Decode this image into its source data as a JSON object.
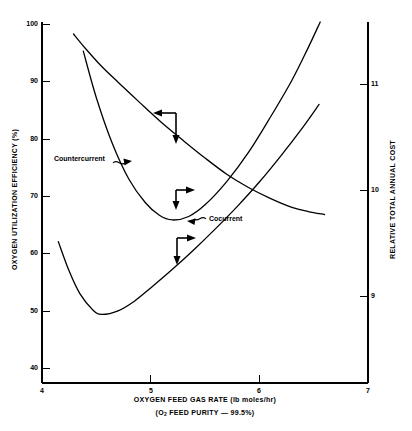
{
  "chart_data": {
    "type": "line",
    "title": "",
    "xlabel": "OXYGEN FEED GAS RATE (lb moles/hr)",
    "xlabel_sub": "(O2 FEED PURITY — 99.5%)",
    "ylabel_left": "OXYGEN UTILIZATION EFFICIENCY (%)",
    "ylabel_right": "RELATIVE TOTAL ANNUAL COST",
    "xlim": [
      4,
      7
    ],
    "ylim_left": [
      40,
      100
    ],
    "ylim_right": [
      8.5,
      11.6
    ],
    "xticks": [
      "4",
      "5",
      "6",
      "7"
    ],
    "xtick_values": [
      4,
      5,
      6,
      7
    ],
    "yticks_left": [
      "100",
      "90",
      "80",
      "70",
      "60",
      "50",
      "40"
    ],
    "ytick_values_left": [
      100,
      90,
      80,
      70,
      60,
      50,
      40
    ],
    "yticks_right": [
      "11",
      "10",
      "9"
    ],
    "ytick_values_right": [
      11,
      10,
      9
    ],
    "grid": false,
    "legend": "inline-annotations",
    "series": [
      {
        "name": "Countercurrent oxygen utilization efficiency",
        "axis": "left",
        "units": "%",
        "points": [
          [
            4.29,
            98.0
          ],
          [
            4.4,
            95.6
          ],
          [
            4.55,
            92.6
          ],
          [
            4.7,
            90.0
          ],
          [
            4.9,
            86.6
          ],
          [
            5.1,
            83.3
          ],
          [
            5.3,
            80.3
          ],
          [
            5.5,
            77.4
          ],
          [
            5.7,
            74.7
          ],
          [
            5.9,
            72.5
          ],
          [
            6.1,
            70.7
          ],
          [
            6.3,
            69.2
          ],
          [
            6.45,
            68.5
          ],
          [
            6.6,
            68.0
          ]
        ]
      },
      {
        "name": "Cocurrent oxygen utilization efficiency",
        "axis": "left",
        "units": "%",
        "points": [
          [
            4.15,
            63.5
          ],
          [
            4.25,
            58.6
          ],
          [
            4.35,
            54.8
          ],
          [
            4.47,
            52.1
          ],
          [
            4.55,
            51.4
          ],
          [
            4.7,
            52.0
          ],
          [
            4.85,
            53.6
          ],
          [
            5.0,
            55.8
          ],
          [
            5.2,
            58.9
          ],
          [
            5.4,
            62.2
          ],
          [
            5.6,
            65.7
          ],
          [
            5.8,
            69.4
          ],
          [
            6.0,
            73.4
          ],
          [
            6.2,
            77.8
          ],
          [
            6.4,
            82.5
          ],
          [
            6.55,
            86.3
          ]
        ]
      },
      {
        "name": "Countercurrent relative total annual cost",
        "axis": "right",
        "units": "relative",
        "points": [
          [
            4.38,
            11.35
          ],
          [
            4.5,
            10.95
          ],
          [
            4.65,
            10.55
          ],
          [
            4.8,
            10.25
          ],
          [
            4.95,
            10.05
          ],
          [
            5.08,
            9.94
          ],
          [
            5.2,
            9.9
          ],
          [
            5.35,
            9.93
          ],
          [
            5.5,
            10.03
          ],
          [
            5.7,
            10.23
          ],
          [
            5.9,
            10.48
          ],
          [
            6.1,
            10.78
          ],
          [
            6.3,
            11.1
          ],
          [
            6.45,
            11.38
          ],
          [
            6.56,
            11.6
          ]
        ]
      }
    ],
    "annotations": [
      {
        "id": "annotation-left-down-top",
        "type": "axis-pointer",
        "description": "Left arrow then down arrow indicating left-axis series",
        "corner": [
          5.22,
          84.8
        ],
        "directions": [
          "left",
          "down"
        ]
      },
      {
        "id": "annotation-right-down-middle",
        "type": "axis-pointer",
        "description": "Right arrow then down arrow indicating right-axis series",
        "corner": [
          5.23,
          70.4
        ],
        "directions": [
          "right",
          "down"
        ]
      },
      {
        "id": "annotation-right-down-bottom",
        "type": "axis-pointer",
        "description": "Right arrow then down arrow indicating left-axis series",
        "corner": [
          5.24,
          62.0
        ],
        "directions": [
          "right",
          "down"
        ]
      }
    ],
    "curve_labels": [
      {
        "id": "countercurrent",
        "text": "Countercurrent",
        "x": 4.35,
        "y": 75.5
      },
      {
        "id": "cocurrent",
        "text": "Cocurrent",
        "x": 5.62,
        "y": 64.8
      }
    ]
  },
  "axes": {
    "left": {
      "title": "OXYGEN UTILIZATION EFFICIENCY (%)",
      "ticks": [
        {
          "label": "100"
        },
        {
          "label": "90"
        },
        {
          "label": "80"
        },
        {
          "label": "70"
        },
        {
          "label": "60"
        },
        {
          "label": "50"
        },
        {
          "label": "40"
        }
      ]
    },
    "right": {
      "title": "RELATIVE TOTAL ANNUAL COST",
      "ticks": [
        {
          "label": "11"
        },
        {
          "label": "10"
        },
        {
          "label": "9"
        }
      ]
    },
    "bottom": {
      "title": "OXYGEN FEED GAS RATE (lb moles/hr)",
      "subtitle_prefix": "(O",
      "subtitle_sub": "2",
      "subtitle_suffix": " FEED PURITY — 99.5%)",
      "ticks": [
        {
          "label": "4"
        },
        {
          "label": "5"
        },
        {
          "label": "6"
        },
        {
          "label": "7"
        }
      ]
    }
  },
  "labels": {
    "countercurrent": "Countercurrent",
    "cocurrent": "Cocurrent"
  },
  "colors": {
    "background": "#ffffff",
    "ink": "#000000"
  }
}
